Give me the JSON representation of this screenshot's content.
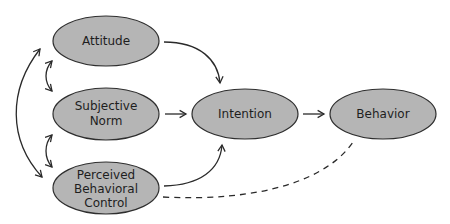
{
  "diagram": {
    "colors": {
      "node_fill": "#b5b5b5",
      "node_stroke": "#2e2e2e",
      "edge": "#2a2a2a",
      "background": "#ffffff"
    },
    "nodes": {
      "attitude": {
        "lines": [
          "Attitude"
        ]
      },
      "subjective_norm": {
        "lines": [
          "Subjective",
          "Norm"
        ]
      },
      "perceived_behavioral_control": {
        "lines": [
          "Perceived",
          "Behavioral",
          "Control"
        ]
      },
      "intention": {
        "lines": [
          "Intention"
        ]
      },
      "behavior": {
        "lines": [
          "Behavior"
        ]
      }
    },
    "edges": [
      {
        "from": "Attitude",
        "to": "Intention",
        "style": "solid",
        "arrow": "end"
      },
      {
        "from": "Subjective Norm",
        "to": "Intention",
        "style": "solid",
        "arrow": "end"
      },
      {
        "from": "Perceived Behavioral Control",
        "to": "Intention",
        "style": "solid",
        "arrow": "end"
      },
      {
        "from": "Intention",
        "to": "Behavior",
        "style": "solid",
        "arrow": "end"
      },
      {
        "from": "Perceived Behavioral Control",
        "to": "Behavior",
        "style": "dashed",
        "arrow": "none"
      },
      {
        "from": "Attitude",
        "to": "Subjective Norm",
        "style": "solid",
        "arrow": "both"
      },
      {
        "from": "Subjective Norm",
        "to": "Perceived Behavioral Control",
        "style": "solid",
        "arrow": "both"
      },
      {
        "from": "Attitude",
        "to": "Perceived Behavioral Control",
        "style": "solid",
        "arrow": "both"
      }
    ]
  }
}
